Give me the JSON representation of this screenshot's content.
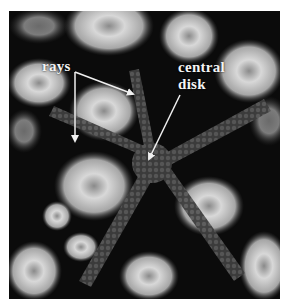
{
  "figure": {
    "labels": [
      {
        "id": "rays",
        "text": "rays"
      },
      {
        "id": "central_disk",
        "line1": "central",
        "line2": "disk"
      }
    ],
    "colors": {
      "background": "#0a0a0a",
      "label": "#f4f4f4",
      "arrow": "#f0f0f0",
      "starfish": "#4a4a4a",
      "coral": "#b8b8b8"
    }
  }
}
